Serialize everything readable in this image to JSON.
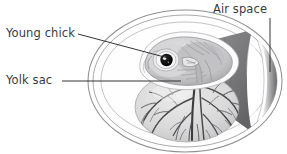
{
  "figure": {
    "background_color": "#ffffff",
    "width": 287,
    "height": 154
  },
  "labels": [
    {
      "id": "young-chick",
      "text": "Young chick",
      "leader": "diagonal-line-to-embryo-head",
      "color": "#3a3a3c"
    },
    {
      "id": "yolk-sac",
      "text": "Yolk sac",
      "leader": "horizontal-line-to-yolk",
      "color": "#3a3a3c"
    },
    {
      "id": "air-space",
      "text": "Air space",
      "leader": "vertical-line-to-air-cell",
      "color": "#3a3a3c"
    }
  ],
  "structures": {
    "shell": {
      "name": "egg-shell-outline",
      "stroke": "#8d8d90"
    },
    "shell_membrane": {
      "name": "shell-membrane",
      "stroke": "#a0a0a4"
    },
    "albumen": {
      "name": "albumen",
      "fill": "#fdfdfd"
    },
    "air_space": {
      "name": "air-space-cell",
      "fill_light": "#f2f2f2",
      "fill_dark": "#6f6f72"
    },
    "chalaza": {
      "name": "chalaza-membrane",
      "fill": "#77777a"
    },
    "embryo": {
      "name": "young-chick-embryo",
      "eye_color": "#0e0e0e",
      "body_fill": "#cfcfd1"
    },
    "yolk_sac": {
      "name": "yolk-sac",
      "fill": "#dedede",
      "vessel_stroke": "#4a4a4c"
    }
  },
  "colors": {
    "ink": "#3a3a3c",
    "line": "#1e1e20",
    "mid_gray": "#8d8d90",
    "dark_gray": "#6f6f72",
    "pale": "#ededed"
  }
}
